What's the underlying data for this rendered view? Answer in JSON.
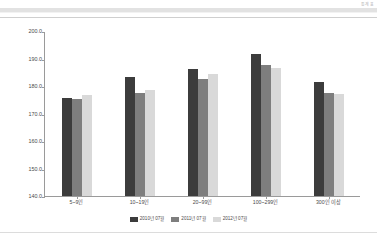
{
  "header": {
    "corner_note": "통계표"
  },
  "chart_data": {
    "type": "bar",
    "title": "",
    "subtitle": "",
    "xlabel": "",
    "ylabel": "",
    "ylim": [
      140.0,
      200.0
    ],
    "ytick_step": 10.0,
    "ytick_labels": [
      "200.0",
      "190.0",
      "180.0",
      "170.0",
      "160.0",
      "150.0",
      "140.0"
    ],
    "ytick_values": [
      200.0,
      190.0,
      180.0,
      170.0,
      160.0,
      150.0,
      140.0
    ],
    "grid": false,
    "legend_position": "bottom-center",
    "categories": [
      "5~9인",
      "10~19인",
      "20~99인",
      "100~299인",
      "300인 이상"
    ],
    "series": [
      {
        "name": "2010년 07월",
        "color": "#3c3c3c",
        "values": [
          175.6,
          183.1,
          186.2,
          191.5,
          181.4
        ]
      },
      {
        "name": "2011년 07월",
        "color": "#7e7e7e",
        "values": [
          175.4,
          177.6,
          182.4,
          187.6,
          177.6
        ]
      },
      {
        "name": "2012년 07월",
        "color": "#d9d9d9",
        "values": [
          176.8,
          178.4,
          184.5,
          186.6,
          177.0
        ]
      }
    ]
  }
}
